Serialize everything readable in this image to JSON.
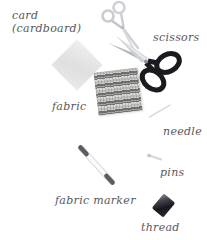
{
  "figure": {
    "background_color": "#ffffff",
    "label_color": "#58585b"
  },
  "labels": {
    "card_line1": "card",
    "card_line2": "(cardboard)",
    "scissors": "scissors",
    "fabric": "fabric",
    "needle": "needle",
    "pins": "pins",
    "fabric_marker": "fabric marker",
    "thread": "thread"
  },
  "items": [
    {
      "icon": "card-image",
      "label": "card (cardboard)",
      "color": "#e6e6e6"
    },
    {
      "icon": "embroidery-scissors-icon",
      "label": "scissors",
      "color": "#c6c8cc"
    },
    {
      "icon": "dressmaker-scissors-icon",
      "label": "scissors",
      "handle_color": "#1b1b1f",
      "blade_color": "#b7bac0"
    },
    {
      "icon": "fabric-swatch-image",
      "label": "fabric",
      "color": "#8f8f8e"
    },
    {
      "icon": "needle-image",
      "label": "needle",
      "color": "#dcdcde"
    },
    {
      "icon": "pin-image",
      "label": "pins",
      "color": "#d0d0d4"
    },
    {
      "icon": "fabric-marker-image",
      "label": "fabric marker",
      "tip_color": "#5b5b62",
      "body_color": "#fbfbfc"
    },
    {
      "icon": "thread-spool-image",
      "label": "thread",
      "color": "#17171d"
    }
  ]
}
